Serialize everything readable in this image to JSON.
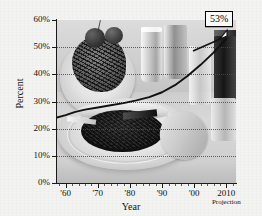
{
  "chart_data": {
    "type": "line",
    "title": "",
    "subtitle": "",
    "xlabel": "Year",
    "ylabel": "Percent",
    "xlim": [
      1957,
      2013
    ],
    "ylim": [
      0,
      60
    ],
    "grid": true,
    "legend": null,
    "x_tick_labels": [
      "'60",
      "'70",
      "'80",
      "'90",
      "'00",
      "2010"
    ],
    "x_tick_values": [
      1960,
      1970,
      1980,
      1990,
      2000,
      2010
    ],
    "y_tick_labels": [
      "0%",
      "10%",
      "20%",
      "30%",
      "40%",
      "50%",
      "60%"
    ],
    "y_tick_values": [
      0,
      10,
      20,
      30,
      40,
      50,
      60
    ],
    "series": [
      {
        "name": "Percent",
        "x": [
          1957,
          1960,
          1963,
          1966,
          1970,
          1974,
          1978,
          1982,
          1986,
          1990,
          1994,
          1998,
          2002,
          2006,
          2010
        ],
        "values": [
          24.0,
          25.0,
          26.2,
          27.0,
          27.8,
          28.6,
          29.4,
          30.4,
          31.6,
          33.4,
          36.0,
          39.5,
          43.5,
          48.0,
          53.0
        ]
      }
    ],
    "annotations": [
      {
        "label": "53%",
        "value": 53,
        "x": 2010,
        "kind": "callout-box"
      },
      {
        "label": "Projection",
        "x": 2010,
        "kind": "axis-note"
      }
    ]
  },
  "axes": {
    "y_title": "Percent",
    "x_title": "Year",
    "projection_note": "Projection"
  },
  "callout": {
    "text": "53%"
  },
  "background": {
    "description": "grayscale food photograph",
    "photo_alt": "plate of spaghetti, drinking glasses, pie on plate, bread and shaker"
  },
  "colors": {
    "page_background": "#f2f2f1",
    "axis": "#1a1a1a",
    "gridline": "#4a4a4a",
    "data_line": "#111111",
    "callout_border": "#000000",
    "callout_fill": "#fbfbfa",
    "text": "#111111"
  }
}
